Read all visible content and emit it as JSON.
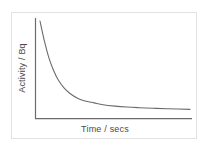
{
  "figure": {
    "background_color": "#ffffff",
    "frame_color": "#e2e2e2",
    "axis_color": "#6b6b6b",
    "curve_color": "#6b6b6b",
    "label_color": "#4a4a4a"
  },
  "chart_data": {
    "type": "line",
    "title": "",
    "subtitle": "",
    "xlabel": "Time / secs",
    "ylabel": "Activity / Bq",
    "annotations": [],
    "legend": [],
    "legend_position": "none",
    "grid": false,
    "axis_ticks": false,
    "tick_labels_x": [],
    "tick_labels_y": [],
    "xlim": [
      0,
      1
    ],
    "ylim": [
      0,
      1
    ],
    "series": [
      {
        "name": "Activity",
        "description": "exponential radioactive decay",
        "x": [
          0.0,
          0.03,
          0.06,
          0.09,
          0.12,
          0.16,
          0.2,
          0.25,
          0.3,
          0.36,
          0.42,
          0.5,
          0.58,
          0.66,
          0.75,
          0.85,
          1.0
        ],
        "y": [
          1.0,
          0.78,
          0.6,
          0.47,
          0.37,
          0.28,
          0.22,
          0.17,
          0.14,
          0.12,
          0.1,
          0.085,
          0.075,
          0.068,
          0.062,
          0.057,
          0.05
        ]
      }
    ]
  }
}
